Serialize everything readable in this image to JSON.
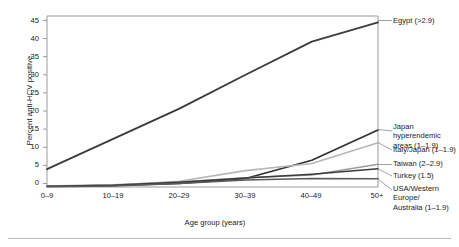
{
  "chart_data": {
    "type": "line",
    "title": "",
    "xlabel": "Age group (years)",
    "ylabel": "Percent anti-HCV positive",
    "categories": [
      "0–9",
      "10–19",
      "20–29",
      "30–39",
      "40–49",
      "50+"
    ],
    "ylim": [
      0,
      48
    ],
    "xlim": [
      0,
      5
    ],
    "yticks": [
      0,
      5,
      10,
      15,
      20,
      25,
      30,
      35,
      40,
      45
    ],
    "ytick_labels": [
      "0",
      "5",
      "10",
      "15",
      "20",
      "25",
      "30",
      "35",
      "40",
      "45"
    ],
    "grid": false,
    "legend": "right-inline-annotations",
    "series": [
      {
        "name": "Egypt (>2.9)",
        "label": "Egypt (>2.9)",
        "color": "#3b3b3b",
        "width": 1.8,
        "values": [
          5.0,
          13.5,
          22.0,
          31.5,
          40.8,
          46.2
        ]
      },
      {
        "name": "Japan hyperendemic areas (1–1.9)",
        "label": "Japan hyperendemic\nareas (1–1.9)",
        "color": "#2e2e2e",
        "width": 1.6,
        "values": [
          0.2,
          0.4,
          1.0,
          2.4,
          7.5,
          16.0
        ]
      },
      {
        "name": "Italy/Japan (1–1.9)",
        "label": "Italy/Japan (1–1.9)",
        "color": "#b6b6b6",
        "width": 1.6,
        "values": [
          0.2,
          0.5,
          1.6,
          4.6,
          6.6,
          12.4
        ]
      },
      {
        "name": "Taiwan (2–2.9)",
        "label": "Taiwan (2–2.9)",
        "color": "#9a9a9a",
        "width": 1.5,
        "values": [
          0.3,
          0.6,
          1.4,
          2.6,
          3.4,
          6.4
        ]
      },
      {
        "name": "Turkey (1.5)",
        "label": "Turkey (1.5)",
        "color": "#3b3b3b",
        "width": 1.5,
        "values": [
          0.2,
          0.5,
          1.3,
          2.5,
          3.6,
          5.1
        ]
      },
      {
        "name": "USA/Western Europe/ Australia (1–1.9)",
        "label": "USA/Western Europe/\nAustralia (1–1.9)",
        "color": "#5a5a5a",
        "width": 1.5,
        "values": [
          0.1,
          0.3,
          1.0,
          2.0,
          2.4,
          2.3
        ]
      }
    ]
  },
  "axis": {
    "y_title": "Percent anti-HCV positive",
    "x_title": "Age group (years)",
    "y_ticks": [
      "45",
      "40",
      "35",
      "30",
      "25",
      "20",
      "15",
      "10",
      "5",
      "0"
    ],
    "x_ticks": [
      "0–9",
      "10–19",
      "20–29",
      "30–39",
      "40–49",
      "50+"
    ]
  },
  "labels": {
    "egypt": "Egypt (>2.9)",
    "japan_hyper": "Japan hyperendemic\nareas (1–1.9)",
    "italy_japan": "Italy/Japan (1–1.9)",
    "taiwan": "Taiwan (2–2.9)",
    "turkey": "Turkey (1.5)",
    "usa_weu_aus": "USA/Western Europe/\nAustralia (1–1.9)"
  },
  "colors": {
    "axis_line": "#9b9b9b",
    "egypt_line": "#3b3b3b",
    "light_gray_line": "#b6b6b6",
    "rule": "#b9b9b9",
    "text": "#1a1a1a",
    "background": "#ffffff"
  }
}
